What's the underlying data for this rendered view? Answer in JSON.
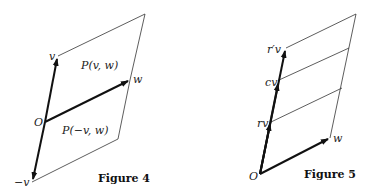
{
  "figures": [
    {
      "caption": "Figure 4",
      "labels": {
        "origin": "O",
        "v": "v",
        "w": "w",
        "neg_v": "−v",
        "region_top": "P(v, w)",
        "region_bottom": "P(−v, w)"
      }
    },
    {
      "caption": "Figure 5",
      "labels": {
        "origin": "O",
        "w": "w",
        "rv": "rv",
        "cv": "cv",
        "r_prime_v": "r′v"
      }
    }
  ]
}
